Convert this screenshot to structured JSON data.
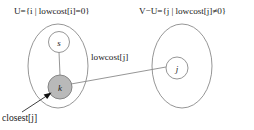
{
  "diagram": {
    "background_color": "#ffffff",
    "labels": {
      "set_u": "U={i | lowcost[i]=0}",
      "set_v_minus_u": "V−U={j | lowcost[j]≠0}",
      "edge_weight": "lowcost[j]",
      "pointer": "closest[j]"
    },
    "nodes": [
      {
        "id": "s",
        "label": "s",
        "fill": "#ffffff",
        "group": "U"
      },
      {
        "id": "k",
        "label": "k",
        "fill": "#b9b9b9",
        "group": "U"
      },
      {
        "id": "j",
        "label": "j",
        "fill": "#ffffff",
        "group": "V-U"
      }
    ],
    "edges": [
      {
        "from": "s",
        "to": "k",
        "label": ""
      },
      {
        "from": "k",
        "to": "j",
        "label": "lowcost[j]"
      }
    ],
    "annotations": [
      {
        "text": "closest[j]",
        "points_to": "k",
        "arrow": true
      }
    ],
    "colors": {
      "outline": "#8a8a8a",
      "node_highlight": "#b9b9b9",
      "text": "#1a1a1a",
      "arrow": "#111111"
    }
  }
}
